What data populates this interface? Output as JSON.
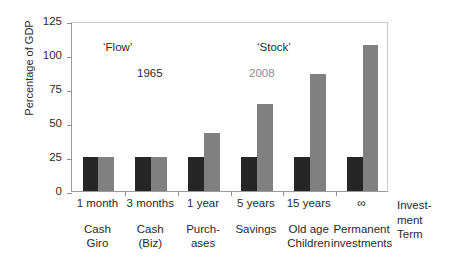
{
  "chart_data": {
    "type": "bar",
    "title": "",
    "xlabel": "Investment Term",
    "ylabel": "Percentage of GDP",
    "ylim": [
      0,
      125
    ],
    "yticks": [
      0,
      25,
      50,
      75,
      100,
      125
    ],
    "grid": false,
    "legend_position": "in-plot annotations",
    "categories": [
      "Cash\nGiro",
      "Cash\n(Biz)",
      "Purch-\nases",
      "Savings",
      "Old age\nChildren",
      "Permanent\ninvestments"
    ],
    "category_terms": [
      "1 month",
      "3 months",
      "1 year",
      "5 years",
      "15 years",
      "∞"
    ],
    "series": [
      {
        "name": "1965",
        "color": "#262626",
        "values": [
          25,
          25,
          25,
          25,
          25,
          25
        ]
      },
      {
        "name": "2008",
        "color": "#808080",
        "values": [
          25,
          25,
          43,
          64,
          86,
          107
        ]
      }
    ],
    "annotations": [
      {
        "text": "‘Flow’",
        "color": "#2b2b2b"
      },
      {
        "text": "‘Stock’",
        "color": "#2b2b2b"
      },
      {
        "text": "1965",
        "color": "#2b2b2b"
      },
      {
        "text": "2008",
        "color": "#8a8a8a"
      }
    ]
  },
  "axis": {
    "y_title": "Percentage of GDP",
    "y_tick_labels": [
      "125",
      "100",
      "75",
      "50",
      "25",
      "0"
    ],
    "x_axis_caption": "Invest-\nment\nTerm"
  },
  "annotations": {
    "flow": "‘Flow’",
    "stock": "‘Stock’",
    "year_1965": "1965",
    "year_2008": "2008"
  },
  "x_labels": [
    {
      "term": "1 month",
      "name": "Cash\nGiro"
    },
    {
      "term": "3 months",
      "name": "Cash\n(Biz)"
    },
    {
      "term": "1 year",
      "name": "Purch-\nases"
    },
    {
      "term": "5 years",
      "name": "Savings"
    },
    {
      "term": "15 years",
      "name": "Old age\nChildren"
    },
    {
      "term": "∞",
      "name": "Permanent\ninvestments"
    }
  ],
  "colors": {
    "series_1965": "#262626",
    "series_2008": "#808080",
    "axis": "#8f8f8f",
    "text": "#2b2b2b",
    "background": "#ffffff"
  }
}
